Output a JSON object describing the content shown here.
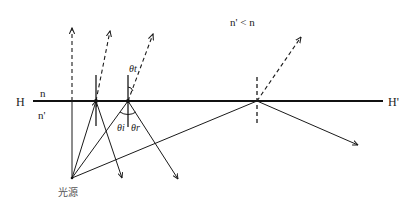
{
  "labels": {
    "interface_left": "H",
    "interface_right": "H'",
    "medium_top": "n",
    "medium_bottom": "n'",
    "condition": "n' < n",
    "source": "光源",
    "theta_t": "θt",
    "theta_i": "θi",
    "theta_r": "θr"
  },
  "colors": {
    "line": "#1a1a1a",
    "text": "#222222"
  }
}
